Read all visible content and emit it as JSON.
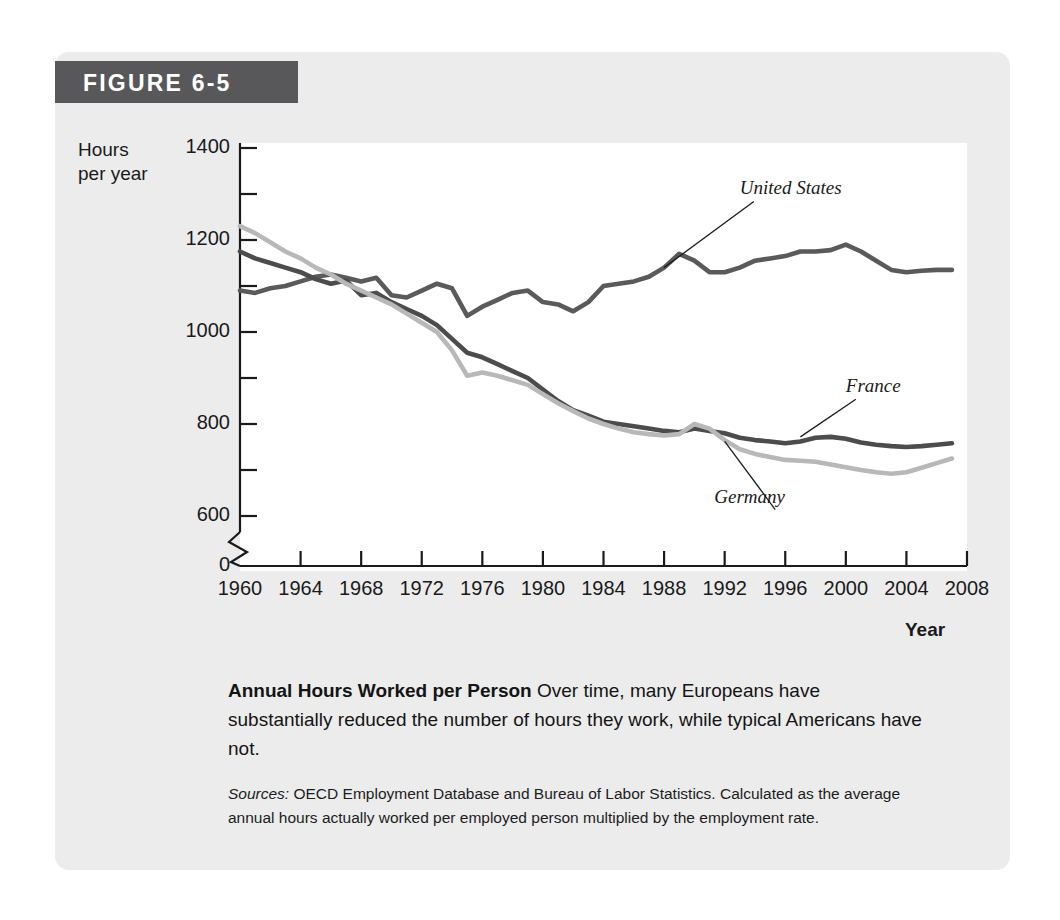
{
  "figure": {
    "number_label": "FIGURE 6-5",
    "bar_color": "#58585a",
    "panel_color": "#ececed"
  },
  "caption": {
    "title": "Annual Hours Worked per Person",
    "body": " Over time, many Europeans have substantially reduced the number of hours they work, while typical Americans have not."
  },
  "sources": {
    "title": "Sources:",
    "body": " OECD Employment Database and Bureau of Labor Statistics. Calculated as the average annual hours actually worked per employed person multiplied by the employment rate."
  },
  "chart_data": {
    "type": "line",
    "title": "Annual Hours Worked per Person",
    "xlabel": "Year",
    "ylabel": "Hours per year",
    "ylabel_lines": [
      "Hours",
      "per year"
    ],
    "xlim": [
      1960,
      2008
    ],
    "ylim": [
      560,
      1400
    ],
    "grid": false,
    "axis_break": true,
    "axis_break_note": "y-axis broken between 0 and 600",
    "ytick_labels": [
      "1400",
      "1200",
      "1000",
      "800",
      "600",
      "0"
    ],
    "ytick_values": [
      1400,
      1200,
      1000,
      800,
      600,
      0
    ],
    "yminor_values": [
      1300,
      1100,
      900,
      700
    ],
    "xtick_labels": [
      "1960",
      "1964",
      "1968",
      "1972",
      "1976",
      "1980",
      "1984",
      "1988",
      "1992",
      "1996",
      "2000",
      "2004",
      "2008"
    ],
    "xtick_values": [
      1960,
      1964,
      1968,
      1972,
      1976,
      1980,
      1984,
      1988,
      1992,
      1996,
      2000,
      2004,
      2008
    ],
    "legend_position": "inline-annotations",
    "x": [
      1960,
      1961,
      1962,
      1963,
      1964,
      1965,
      1966,
      1967,
      1968,
      1969,
      1970,
      1971,
      1972,
      1973,
      1974,
      1975,
      1976,
      1977,
      1978,
      1979,
      1980,
      1981,
      1982,
      1983,
      1984,
      1985,
      1986,
      1987,
      1988,
      1989,
      1990,
      1991,
      1992,
      1993,
      1994,
      1995,
      1996,
      1997,
      1998,
      1999,
      2000,
      2001,
      2002,
      2003,
      2004,
      2005,
      2006,
      2007
    ],
    "series": [
      {
        "name": "United States",
        "color": "#5a5a5a",
        "label_position": {
          "x": 1993,
          "y": 1310
        },
        "values": [
          1090,
          1085,
          1095,
          1100,
          1110,
          1120,
          1125,
          1118,
          1110,
          1118,
          1080,
          1075,
          1090,
          1105,
          1095,
          1035,
          1055,
          1070,
          1085,
          1090,
          1065,
          1060,
          1045,
          1065,
          1100,
          1105,
          1110,
          1120,
          1140,
          1170,
          1155,
          1130,
          1130,
          1140,
          1155,
          1160,
          1165,
          1175,
          1175,
          1178,
          1190,
          1175,
          1155,
          1135,
          1130,
          1133,
          1135,
          1135
        ]
      },
      {
        "name": "France",
        "color": "#4c4c4c",
        "label_position": {
          "x": 2000,
          "y": 880
        },
        "values": [
          1175,
          1160,
          1150,
          1140,
          1130,
          1115,
          1105,
          1112,
          1080,
          1085,
          1065,
          1050,
          1035,
          1015,
          985,
          955,
          945,
          930,
          915,
          900,
          875,
          850,
          830,
          818,
          805,
          800,
          795,
          790,
          785,
          782,
          790,
          785,
          780,
          770,
          765,
          762,
          758,
          762,
          770,
          772,
          768,
          760,
          755,
          752,
          750,
          752,
          755,
          758
        ]
      },
      {
        "name": "Germany",
        "color": "#b8b8b8",
        "label_position": {
          "x": 1996,
          "y": 640
        },
        "values": [
          1230,
          1215,
          1195,
          1175,
          1160,
          1140,
          1125,
          1105,
          1090,
          1075,
          1060,
          1040,
          1020,
          1000,
          960,
          905,
          912,
          905,
          895,
          885,
          865,
          845,
          828,
          812,
          800,
          790,
          782,
          778,
          775,
          778,
          800,
          790,
          765,
          745,
          735,
          728,
          722,
          720,
          718,
          712,
          706,
          700,
          695,
          692,
          695,
          705,
          715,
          725
        ]
      }
    ]
  }
}
